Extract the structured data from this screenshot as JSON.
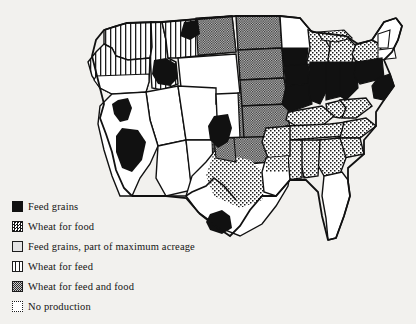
{
  "figure": {
    "type": "thematic-choropleth-map",
    "region": "Contiguous United States",
    "title": "",
    "background_color": "#f2f1ee",
    "ink_color": "#111111"
  },
  "legend": {
    "items": [
      {
        "key": "feed_grains",
        "label": "Feed grains",
        "swatch": "solid-black-square",
        "swatch_class": "sw-feed",
        "color": "#111111"
      },
      {
        "key": "wheat_for_food",
        "label": "Wheat for food",
        "swatch": "coarse-checker-square",
        "swatch_class": "sw-wheatfood",
        "color": "#161616"
      },
      {
        "key": "feed_grains_max",
        "label": "Feed grains, part of maximum acreage",
        "swatch": "light-gray-square",
        "swatch_class": "sw-maxacre",
        "color": "#e4e4e4"
      },
      {
        "key": "wheat_for_feed",
        "label": "Wheat for feed",
        "swatch": "vertical-lines-square",
        "swatch_class": "sw-wheatfeed",
        "color": "#1d1d1d"
      },
      {
        "key": "wheat_feed_and_food",
        "label": "Wheat for feed and food",
        "swatch": "fine-gray-checker-square",
        "swatch_class": "sw-wheatboth",
        "color": "#8d8d8d"
      },
      {
        "key": "no_production",
        "label": "No production",
        "swatch": "white-dotted-border-square",
        "swatch_class": "sw-noprod",
        "color": "#ffffff"
      }
    ]
  },
  "map_regions": {
    "feed_grains_solid_black": [
      "Iowa",
      "Illinois",
      "Indiana",
      "Ohio",
      "Minnesota (south)",
      "Missouri (north)",
      "Pennsylvania",
      "New Jersey",
      "Delaware",
      "Maryland",
      "California Central Valley",
      "Nevada (west)",
      "Idaho (south)",
      "Oklahoma Panhandle",
      "Texas Gulf Coast",
      "Kentucky (north)"
    ],
    "wheat_for_feed_and_food_checker": [
      "North Dakota",
      "South Dakota",
      "Nebraska",
      "Kansas",
      "Oklahoma",
      "Colorado (east)",
      "Texas Panhandle",
      "Montana (east)"
    ],
    "wheat_for_feed_vertical_lines": [
      "Washington",
      "Oregon (north)",
      "Idaho (north)",
      "Montana (west)"
    ],
    "wheat_for_food_dotted": [
      "Michigan",
      "Wisconsin",
      "Virginia",
      "North Carolina",
      "South Carolina",
      "Georgia",
      "Alabama",
      "Mississippi",
      "Tennessee",
      "West Virginia",
      "Arkansas",
      "Louisiana (north)",
      "New Mexico (east)",
      "Texas (central)",
      "New York (south)"
    ],
    "no_production_white": [
      "Maine",
      "New Hampshire",
      "Vermont",
      "Massachusetts",
      "Rhode Island",
      "Connecticut",
      "Florida",
      "Arizona",
      "Utah",
      "Nevada (east)",
      "Wyoming",
      "New Mexico (west)",
      "Oregon (south)",
      "California (coast)"
    ]
  }
}
